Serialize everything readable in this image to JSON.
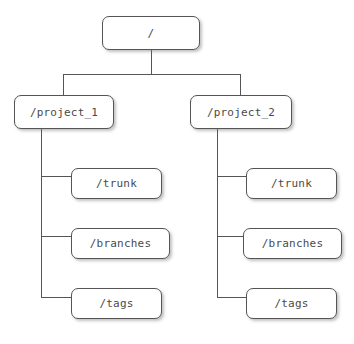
{
  "diagram": {
    "type": "repository-directory-tree",
    "canvas": {
      "width": 354,
      "height": 344,
      "background": "#ffffff"
    },
    "style": {
      "node_fill": "#ffffff",
      "node_border": "#555555",
      "node_text": "#4a4a4a",
      "edge_color": "#555555",
      "shadow": "rgba(120,120,120,0.45)"
    },
    "nodes": [
      {
        "id": "root",
        "label": "/",
        "x": 102,
        "y": 16,
        "w": 98,
        "h": 34
      },
      {
        "id": "project_1",
        "label": "/project_1",
        "x": 14,
        "y": 95,
        "w": 100,
        "h": 34
      },
      {
        "id": "project_2",
        "label": "/project_2",
        "x": 190,
        "y": 95,
        "w": 102,
        "h": 34
      },
      {
        "id": "p1_trunk",
        "label": "/trunk",
        "x": 71,
        "y": 168,
        "w": 91,
        "h": 31
      },
      {
        "id": "p1_branches",
        "label": "/branches",
        "x": 71,
        "y": 228,
        "w": 99,
        "h": 31
      },
      {
        "id": "p1_tags",
        "label": "/tags",
        "x": 71,
        "y": 288,
        "w": 91,
        "h": 31
      },
      {
        "id": "p2_trunk",
        "label": "/trunk",
        "x": 246,
        "y": 168,
        "w": 91,
        "h": 31
      },
      {
        "id": "p2_branches",
        "label": "/branches",
        "x": 243,
        "y": 228,
        "w": 99,
        "h": 31
      },
      {
        "id": "p2_tags",
        "label": "/tags",
        "x": 246,
        "y": 288,
        "w": 91,
        "h": 31
      }
    ],
    "edges": [
      {
        "from": "root",
        "to": "project_1",
        "kind": "orthogonal-bus"
      },
      {
        "from": "root",
        "to": "project_2",
        "kind": "orthogonal-bus"
      },
      {
        "from": "project_1",
        "to": "p1_trunk",
        "kind": "elbow"
      },
      {
        "from": "project_1",
        "to": "p1_branches",
        "kind": "elbow"
      },
      {
        "from": "project_1",
        "to": "p1_tags",
        "kind": "elbow"
      },
      {
        "from": "project_2",
        "to": "p2_trunk",
        "kind": "elbow"
      },
      {
        "from": "project_2",
        "to": "p2_branches",
        "kind": "elbow"
      },
      {
        "from": "project_2",
        "to": "p2_tags",
        "kind": "elbow"
      }
    ],
    "geometry": {
      "root_stem_x": 151,
      "bus_y": 74,
      "left_drop_x": 63,
      "right_drop_x": 240,
      "left_spine_x": 41,
      "right_spine_x": 217,
      "left_spine_top": 129,
      "right_spine_top": 129,
      "elbow_y": [
        176,
        236,
        297
      ]
    }
  }
}
